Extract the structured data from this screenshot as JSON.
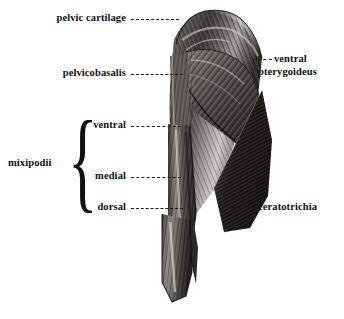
{
  "figure": {
    "kind": "anatomical-illustration",
    "background_color": "#ffffff",
    "ink_color": "#111111"
  },
  "labels": {
    "left": [
      {
        "id": "pelvic-cartilage",
        "text": "pelvic cartilage",
        "side": "left"
      },
      {
        "id": "pelvicobasalis",
        "text": "pelvicobasalis",
        "side": "left"
      },
      {
        "id": "ventral",
        "text": "ventral",
        "side": "left"
      },
      {
        "id": "medial",
        "text": "medial",
        "side": "left"
      },
      {
        "id": "dorsal",
        "text": "dorsal",
        "side": "left"
      }
    ],
    "group": {
      "id": "mixipodii",
      "text": "mixipodii",
      "brace": "{",
      "members": [
        "ventral",
        "medial",
        "dorsal"
      ]
    },
    "right": [
      {
        "id": "ventral-pterygoideus",
        "text_line1": "ventral",
        "text_line2": "pterygoideus",
        "side": "right"
      },
      {
        "id": "ceratotrichia",
        "text": "ceratotrichia",
        "side": "right"
      }
    ]
  },
  "artist_mark": {
    "text": "A",
    "present": true
  }
}
